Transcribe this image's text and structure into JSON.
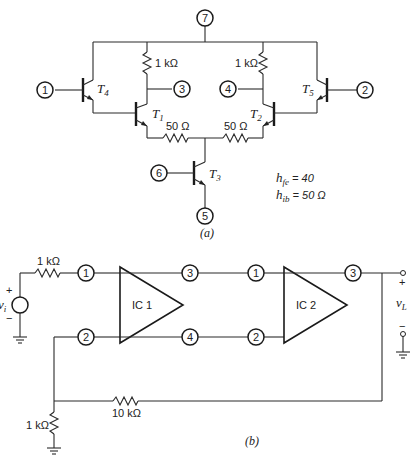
{
  "figure_a": {
    "caption": "(a)",
    "nodes": {
      "n1": "1",
      "n2": "2",
      "n3": "3",
      "n4": "4",
      "n5": "5",
      "n6": "6",
      "n7": "7"
    },
    "transistors": {
      "T1": {
        "label": "T",
        "sub": "1"
      },
      "T2": {
        "label": "T",
        "sub": "2"
      },
      "T3": {
        "label": "T",
        "sub": "3"
      },
      "T4": {
        "label": "T",
        "sub": "4"
      },
      "T5": {
        "label": "T",
        "sub": "5"
      }
    },
    "resistors": {
      "r_left_collector": "1 kΩ",
      "r_right_collector": "1 kΩ",
      "r_left_emitter": "50 Ω",
      "r_right_emitter": "50 Ω"
    },
    "parameters": {
      "hfe_label": "h",
      "hfe_sub": "fe",
      "hfe_value": " = 40",
      "hib_label": "h",
      "hib_sub": "ib",
      "hib_value": " = 50 Ω"
    }
  },
  "figure_b": {
    "caption": "(b)",
    "source": {
      "label": "v",
      "sub": "i",
      "plus": "+",
      "minus": "−"
    },
    "input_resistor": "1 kΩ",
    "ic1": {
      "label": "IC 1",
      "pins": {
        "in_top": "1",
        "in_bottom": "2",
        "out_top": "3",
        "out_bottom": "4"
      }
    },
    "ic2": {
      "label": "IC 2",
      "pins": {
        "in_top": "1",
        "in_bottom": "2",
        "out": "3"
      }
    },
    "output": {
      "label": "v",
      "sub": "L",
      "plus": "+",
      "minus": "−"
    },
    "feedback_resistor": "10 kΩ",
    "ground_resistor": "1 kΩ"
  }
}
